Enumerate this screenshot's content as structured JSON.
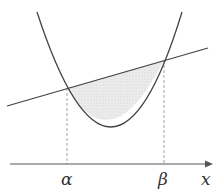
{
  "diagram": {
    "type": "parabola-line-region",
    "labels": {
      "alpha": "α",
      "beta": "β",
      "x_axis": "x"
    },
    "colors": {
      "stroke": "#444444",
      "shade": "#e6e6e6",
      "dashed": "#999999"
    }
  }
}
